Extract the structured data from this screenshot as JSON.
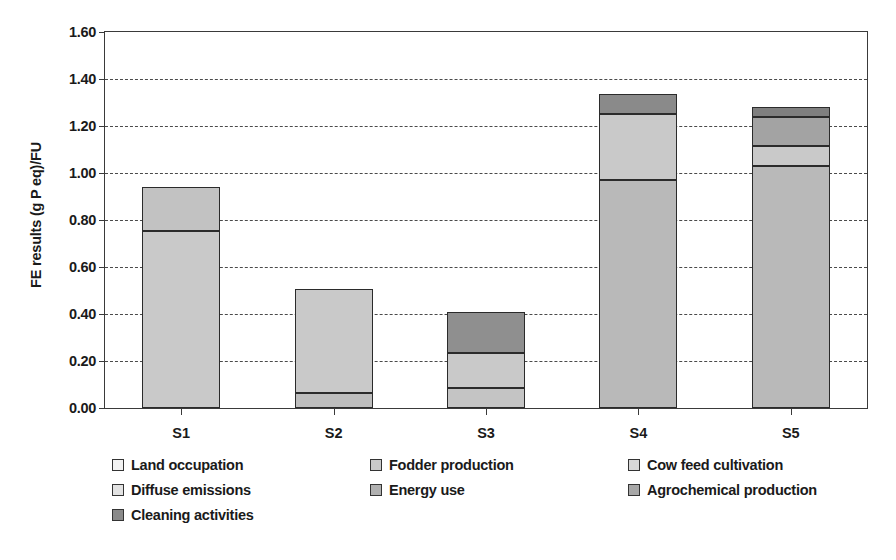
{
  "chart_data": {
    "type": "bar",
    "subtype": "stacked-vertical",
    "title": "",
    "xlabel": "",
    "ylabel": "FE results (g P eq)/FU",
    "ylim": [
      0.0,
      1.6
    ],
    "ytick_labels": [
      "0.00",
      "0.20",
      "0.40",
      "0.60",
      "0.80",
      "1.00",
      "1.20",
      "1.40",
      "1.60"
    ],
    "ytick_values": [
      0.0,
      0.2,
      0.4,
      0.6,
      0.8,
      1.0,
      1.2,
      1.4,
      1.6
    ],
    "grid": "horizontal-dashed",
    "legend_position": "below-plot-three-columns",
    "categories": [
      "S1",
      "S2",
      "S3",
      "S4",
      "S5"
    ],
    "series": [
      {
        "name": "Land occupation",
        "color": "#f2f2f2",
        "values": [
          0.0,
          0.0,
          0.0,
          0.0,
          0.0
        ]
      },
      {
        "name": "Fodder production",
        "color": "#c9c9c9",
        "values": [
          0.755,
          0.0,
          0.0,
          0.97,
          1.03
        ]
      },
      {
        "name": "Cow feed cultivation",
        "color": "#d7d7d7",
        "values": [
          0.0,
          0.44,
          0.15,
          0.0,
          0.0
        ]
      },
      {
        "name": "Diffuse emissions",
        "color": "#e2e2e2",
        "values": [
          0.185,
          0.0,
          0.0,
          0.28,
          0.085
        ]
      },
      {
        "name": "Energy use",
        "color": "#b0b0b0",
        "values": [
          0.0,
          0.065,
          0.085,
          0.0,
          0.0
        ]
      },
      {
        "name": "Agrochemical production",
        "color": "#a8a8a8",
        "values": [
          0.0,
          0.0,
          0.0,
          0.0,
          0.125
        ]
      },
      {
        "name": "Cleaning activities",
        "color": "#8a8a8a",
        "values": [
          0.0,
          0.0,
          0.175,
          0.085,
          0.04
        ]
      }
    ],
    "totals": [
      0.94,
      0.505,
      0.41,
      1.335,
      1.28
    ],
    "bar_stacks": [
      {
        "category": "S1",
        "segments": [
          {
            "label": "Fodder production",
            "from": 0.0,
            "to": 0.755,
            "color": "#c9c9c9"
          },
          {
            "label": "Diffuse emissions",
            "from": 0.755,
            "to": 0.94,
            "color": "#c2c2c2"
          }
        ]
      },
      {
        "category": "S2",
        "segments": [
          {
            "label": "Energy use",
            "from": 0.0,
            "to": 0.065,
            "color": "#bdbdbd"
          },
          {
            "label": "Cow feed cultivation",
            "from": 0.065,
            "to": 0.505,
            "color": "#c9c9c9"
          }
        ]
      },
      {
        "category": "S3",
        "segments": [
          {
            "label": "Energy use",
            "from": 0.0,
            "to": 0.085,
            "color": "#c4c4c4"
          },
          {
            "label": "Cow feed cultivation",
            "from": 0.085,
            "to": 0.235,
            "color": "#c9c9c9"
          },
          {
            "label": "Cleaning activities",
            "from": 0.235,
            "to": 0.41,
            "color": "#8f8f8f"
          }
        ]
      },
      {
        "category": "S4",
        "segments": [
          {
            "label": "Fodder production",
            "from": 0.0,
            "to": 0.97,
            "color": "#b9b9b9"
          },
          {
            "label": "Diffuse emissions",
            "from": 0.97,
            "to": 1.25,
            "color": "#c9c9c9"
          },
          {
            "label": "Cleaning activities",
            "from": 1.25,
            "to": 1.335,
            "color": "#8a8a8a"
          }
        ]
      },
      {
        "category": "S5",
        "segments": [
          {
            "label": "Fodder production",
            "from": 0.0,
            "to": 1.03,
            "color": "#b9b9b9"
          },
          {
            "label": "Diffuse emissions",
            "from": 1.03,
            "to": 1.115,
            "color": "#c9c9c9"
          },
          {
            "label": "Agrochemical production",
            "from": 1.115,
            "to": 1.24,
            "color": "#a3a3a3"
          },
          {
            "label": "Cleaning activities",
            "from": 1.24,
            "to": 1.28,
            "color": "#7f7f7f"
          }
        ]
      }
    ]
  },
  "legend": {
    "columns": [
      [
        {
          "label": "Land occupation",
          "color": "#f2f2f2"
        },
        {
          "label": "Diffuse emissions",
          "color": "#e2e2e2"
        },
        {
          "label": "Cleaning activities",
          "color": "#8a8a8a"
        }
      ],
      [
        {
          "label": "Fodder production",
          "color": "#c9c9c9"
        },
        {
          "label": "Energy use",
          "color": "#b0b0b0"
        }
      ],
      [
        {
          "label": "Cow feed cultivation",
          "color": "#d7d7d7"
        },
        {
          "label": "Agrochemical production",
          "color": "#a8a8a8"
        }
      ]
    ]
  },
  "colors": {
    "axis": "#3a3a3a",
    "grid": "#4a4a4a",
    "text": "#1a1a1a",
    "bar_outline": "#2b2b2b",
    "background": "#ffffff"
  }
}
